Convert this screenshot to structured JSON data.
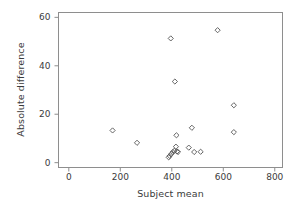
{
  "chart_data": {
    "type": "scatter",
    "title": "",
    "subtitle": "",
    "xlabel": "Subject mean",
    "ylabel": "Absolute difference",
    "xlim": [
      -40,
      830
    ],
    "ylim": [
      -2,
      62
    ],
    "xticks": [
      0,
      200,
      400,
      600,
      800
    ],
    "yticks": [
      0,
      20,
      40,
      60
    ],
    "xticklabels": [
      "0",
      "200",
      "400",
      "600",
      "800"
    ],
    "yticklabels": [
      "0",
      "20",
      "40",
      "60"
    ],
    "grid": false,
    "legend": null,
    "marker": "open-diamond",
    "marker_color": "#555555",
    "frame": true,
    "points": [
      {
        "x": 170,
        "y": 13.3
      },
      {
        "x": 265,
        "y": 8.2
      },
      {
        "x": 388,
        "y": 2.2
      },
      {
        "x": 392,
        "y": 2.8
      },
      {
        "x": 398,
        "y": 3.6
      },
      {
        "x": 404,
        "y": 4.4
      },
      {
        "x": 410,
        "y": 4.9
      },
      {
        "x": 416,
        "y": 6.6
      },
      {
        "x": 420,
        "y": 4.6
      },
      {
        "x": 424,
        "y": 4.4
      },
      {
        "x": 396,
        "y": 51.3
      },
      {
        "x": 412,
        "y": 33.5
      },
      {
        "x": 418,
        "y": 11.3
      },
      {
        "x": 466,
        "y": 6.2
      },
      {
        "x": 478,
        "y": 14.4
      },
      {
        "x": 487,
        "y": 4.4
      },
      {
        "x": 512,
        "y": 4.5
      },
      {
        "x": 578,
        "y": 54.7
      },
      {
        "x": 641,
        "y": 23.7
      },
      {
        "x": 641,
        "y": 12.6
      }
    ]
  },
  "axes": {
    "x_label": "Subject mean",
    "y_label": "Absolute difference"
  }
}
